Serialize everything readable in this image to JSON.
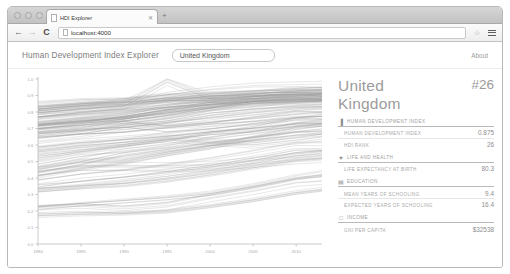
{
  "browser": {
    "tab_title": "HDI Explorer",
    "tab_close_icon": "close-icon",
    "new_tab_icon": "plus-icon",
    "back_icon": "back-arrow-icon",
    "forward_icon": "forward-arrow-icon",
    "reload_icon": "reload-icon",
    "url": "localhost:4000",
    "star_icon": "star-icon",
    "menu_icon": "hamburger-menu-icon",
    "page_icon": "page-icon"
  },
  "app": {
    "title": "Human Development Index Explorer",
    "about_label": "About",
    "search": {
      "value": "United Kingdom",
      "placeholder": "Search for a country"
    }
  },
  "detail": {
    "country_name": "United Kingdom",
    "rank": "#26",
    "groups": [
      {
        "icon": "chart-bar-icon",
        "label": "Human Development Index",
        "rows": [
          {
            "label": "Human Development Index",
            "value": "0.875"
          },
          {
            "label": "HDI Rank",
            "value": "26"
          }
        ]
      },
      {
        "icon": "heart-icon",
        "label": "Life and Health",
        "rows": [
          {
            "label": "Life Expectancy at Birth",
            "value": "80.3"
          }
        ]
      },
      {
        "icon": "graduation-cap-icon",
        "label": "Education",
        "rows": [
          {
            "label": "Mean Years of Schooling",
            "value": "9.4"
          },
          {
            "label": "Expected Years of Schooling",
            "value": "16.4"
          }
        ]
      },
      {
        "icon": "money-icon",
        "label": "Income",
        "rows": [
          {
            "label": "GNI Per Capita",
            "value": "$32538"
          }
        ]
      }
    ]
  },
  "chart_data": {
    "type": "line",
    "title": "",
    "xlabel": "",
    "ylabel": "",
    "xlim": [
      1980,
      2013
    ],
    "ylim": [
      0.0,
      1.0
    ],
    "grid": true,
    "legend": "none",
    "line_color": "#9a9a9a",
    "x_ticks": [
      1980,
      1985,
      1990,
      1995,
      2000,
      2005,
      2010
    ],
    "y_ticks": [
      "0.0",
      "0.1",
      "0.2",
      "0.3",
      "0.4",
      "0.5",
      "0.6",
      "0.7",
      "0.8",
      "0.9",
      "1.0"
    ],
    "x": [
      1980,
      1985,
      1990,
      1995,
      2000,
      2005,
      2010,
      2013
    ],
    "series": [
      {
        "name": "Norway",
        "values": [
          0.793,
          0.821,
          0.849,
          0.886,
          0.917,
          0.938,
          0.942,
          0.944
        ]
      },
      {
        "name": "Australia",
        "values": [
          0.841,
          0.859,
          0.866,
          0.891,
          0.898,
          0.912,
          0.927,
          0.933
        ]
      },
      {
        "name": "Switzerland",
        "values": [
          0.81,
          0.83,
          0.844,
          0.991,
          0.889,
          0.898,
          0.924,
          0.917
        ]
      },
      {
        "name": "Netherlands",
        "values": [
          0.783,
          0.812,
          0.829,
          0.861,
          0.877,
          0.89,
          0.909,
          0.915
        ]
      },
      {
        "name": "United States",
        "values": [
          0.825,
          0.845,
          0.86,
          0.88,
          0.883,
          0.897,
          0.908,
          0.914
        ]
      },
      {
        "name": "Germany",
        "values": [
          0.739,
          0.765,
          0.782,
          0.824,
          0.854,
          0.887,
          0.906,
          0.911
        ]
      },
      {
        "name": "Canada",
        "values": [
          0.817,
          0.841,
          0.857,
          0.867,
          0.867,
          0.892,
          0.901,
          0.902
        ]
      },
      {
        "name": "Sweden",
        "values": [
          0.785,
          0.803,
          0.816,
          0.86,
          0.894,
          0.896,
          0.901,
          0.898
        ]
      },
      {
        "name": "Japan",
        "values": [
          0.772,
          0.796,
          0.816,
          0.838,
          0.855,
          0.873,
          0.884,
          0.89
        ]
      },
      {
        "name": "United Kingdom",
        "values": [
          0.735,
          0.755,
          0.773,
          0.82,
          0.86,
          0.864,
          0.87,
          0.875
        ]
      },
      {
        "name": "France",
        "values": [
          0.722,
          0.752,
          0.779,
          0.821,
          0.848,
          0.869,
          0.88,
          0.884
        ]
      },
      {
        "name": "Italy",
        "values": [
          0.718,
          0.74,
          0.764,
          0.789,
          0.825,
          0.858,
          0.869,
          0.872
        ]
      },
      {
        "name": "Spain",
        "values": [
          0.691,
          0.714,
          0.755,
          0.791,
          0.826,
          0.853,
          0.864,
          0.869
        ]
      },
      {
        "name": "Czech Republic",
        "values": [
          0.7,
          0.718,
          0.729,
          0.762,
          0.807,
          0.85,
          0.863,
          0.861
        ]
      },
      {
        "name": "Poland",
        "values": [
          0.664,
          0.681,
          0.712,
          0.738,
          0.784,
          0.806,
          0.829,
          0.834
        ]
      },
      {
        "name": "Chile",
        "values": [
          0.638,
          0.663,
          0.702,
          0.726,
          0.759,
          0.788,
          0.813,
          0.822
        ]
      },
      {
        "name": "Argentina",
        "values": [
          0.665,
          0.687,
          0.699,
          0.73,
          0.753,
          0.771,
          0.799,
          0.808
        ]
      },
      {
        "name": "Russian Federation",
        "values": [
          0.69,
          0.709,
          0.729,
          0.7,
          0.717,
          0.75,
          0.782,
          0.778
        ]
      },
      {
        "name": "Mexico",
        "values": [
          0.598,
          0.627,
          0.648,
          0.67,
          0.699,
          0.723,
          0.751,
          0.756
        ]
      },
      {
        "name": "Brazil",
        "values": [
          0.545,
          0.575,
          0.608,
          0.65,
          0.683,
          0.699,
          0.737,
          0.744
        ]
      },
      {
        "name": "Turkey",
        "values": [
          0.496,
          0.543,
          0.576,
          0.604,
          0.653,
          0.687,
          0.738,
          0.759
        ]
      },
      {
        "name": "China",
        "values": [
          0.423,
          0.467,
          0.502,
          0.549,
          0.591,
          0.645,
          0.701,
          0.719
        ]
      },
      {
        "name": "Indonesia",
        "values": [
          0.471,
          0.516,
          0.528,
          0.571,
          0.609,
          0.64,
          0.671,
          0.684
        ]
      },
      {
        "name": "Egypt",
        "values": [
          0.445,
          0.491,
          0.546,
          0.577,
          0.611,
          0.645,
          0.676,
          0.682
        ]
      },
      {
        "name": "South Africa",
        "values": [
          0.57,
          0.601,
          0.621,
          0.648,
          0.628,
          0.611,
          0.638,
          0.658
        ]
      },
      {
        "name": "India",
        "values": [
          0.369,
          0.404,
          0.428,
          0.46,
          0.496,
          0.539,
          0.586,
          0.586
        ]
      },
      {
        "name": "Bangladesh",
        "values": [
          0.336,
          0.358,
          0.386,
          0.415,
          0.453,
          0.496,
          0.545,
          0.558
        ]
      },
      {
        "name": "Kenya",
        "values": [
          0.442,
          0.473,
          0.473,
          0.47,
          0.477,
          0.5,
          0.523,
          0.535
        ]
      },
      {
        "name": "Nigeria",
        "values": [
          0.311,
          0.329,
          0.343,
          0.37,
          0.406,
          0.448,
          0.493,
          0.504
        ]
      },
      {
        "name": "Ethiopia",
        "values": [
          0.23,
          0.251,
          0.27,
          0.289,
          0.315,
          0.359,
          0.412,
          0.435
        ]
      },
      {
        "name": "Mozambique",
        "values": [
          0.217,
          0.227,
          0.213,
          0.235,
          0.285,
          0.33,
          0.381,
          0.393
        ]
      },
      {
        "name": "Niger",
        "values": [
          0.18,
          0.189,
          0.193,
          0.205,
          0.236,
          0.273,
          0.318,
          0.337
        ]
      }
    ]
  }
}
